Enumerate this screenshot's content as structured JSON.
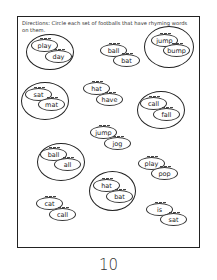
{
  "worksheet": {
    "directions": "Directions: Circle each set of footballs that have rhyming words on them.",
    "page_number": "10",
    "pairs": [
      {
        "top": "play",
        "bottom": "day",
        "circled": true
      },
      {
        "top": "ball",
        "bottom": "bat",
        "circled": false
      },
      {
        "top": "jump",
        "bottom": "bump",
        "circled": true
      },
      {
        "top": "sat",
        "bottom": "mat",
        "circled": true
      },
      {
        "top": "hat",
        "bottom": "have",
        "circled": false
      },
      {
        "top": "call",
        "bottom": "fall",
        "circled": true
      },
      {
        "top": "jump",
        "bottom": "jog",
        "circled": false
      },
      {
        "top": "ball",
        "bottom": "all",
        "circled": true
      },
      {
        "top": "play",
        "bottom": "pop",
        "circled": false
      },
      {
        "top": "hat",
        "bottom": "bat",
        "circled": true
      },
      {
        "top": "cat",
        "bottom": "call",
        "circled": false
      },
      {
        "top": "is",
        "bottom": "sat",
        "circled": false
      }
    ]
  }
}
